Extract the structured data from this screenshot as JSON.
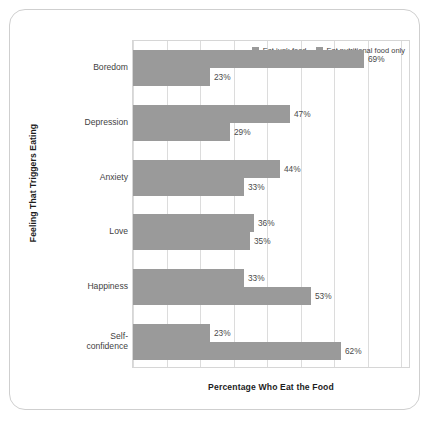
{
  "chart_data": {
    "type": "bar",
    "orientation": "horizontal",
    "title": "",
    "xlabel": "Percentage Who Eat the Food",
    "ylabel": "Feeling That Triggers Eating",
    "categories": [
      "Boredom",
      "Depression",
      "Anxiety",
      "Love",
      "Happiness",
      "Self-\nconfidence"
    ],
    "series": [
      {
        "name": "Eat junk food",
        "color": "#9a9a9a",
        "values": [
          69,
          47,
          44,
          36,
          33,
          23
        ],
        "labels": [
          "69%",
          "47%",
          "44%",
          "36%",
          "33%",
          "23%"
        ]
      },
      {
        "name": "Eat nutritional food only",
        "color": "#9a9a9a",
        "values": [
          23,
          29,
          33,
          35,
          53,
          62
        ],
        "labels": [
          "23%",
          "29%",
          "33%",
          "35%",
          "53%",
          "62%"
        ]
      }
    ],
    "xlim": [
      0,
      80
    ],
    "xticks": [
      0,
      10,
      20,
      30,
      40,
      50,
      60,
      70,
      80
    ],
    "xtick_labels": [],
    "grid": "vertical",
    "legend_position": "top-right",
    "value_labels": true
  },
  "axis": {
    "y_title": "Feeling That Triggers Eating",
    "x_title": "Percentage Who Eat the Food"
  },
  "legend": {
    "entries": [
      {
        "label": "Eat junk food",
        "color": "#9a9a9a"
      },
      {
        "label": "Eat nutritional food only",
        "color": "#9a9a9a"
      }
    ]
  },
  "categories": [
    {
      "label": "Boredom"
    },
    {
      "label": "Depression"
    },
    {
      "label": "Anxiety"
    },
    {
      "label": "Love"
    },
    {
      "label": "Happiness"
    },
    {
      "label": "Self-confidence",
      "line1": "Self-",
      "line2": "confidence"
    }
  ],
  "colors": {
    "bar": "#9a9a9a",
    "gridline": "#dcdcdc",
    "plot_border": "#d6d6d6",
    "frame_border": "#cfcfcf",
    "text": "#3f3f3f",
    "background": "#ffffff"
  }
}
